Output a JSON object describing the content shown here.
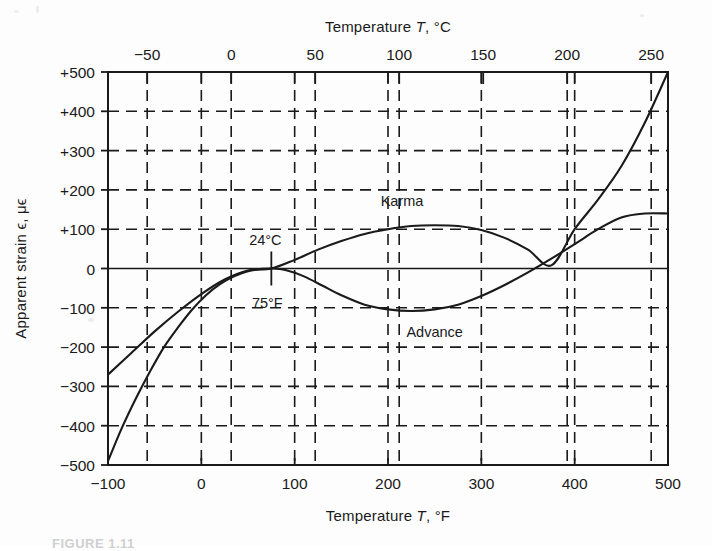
{
  "figure": {
    "caption": "FIGURE 1.11",
    "background_color": "#fdfdfd",
    "ink_color": "#1a1a1a"
  },
  "chart_data": {
    "type": "line",
    "title": "",
    "subtitle": "",
    "xlabel": "Temperature T, °F",
    "xlabel_top": "Temperature T, °C",
    "ylabel": "Apparent strain ϵ, μϵ",
    "xlim": [
      -100,
      500
    ],
    "ylim": [
      -500,
      500
    ],
    "xlim_celsius": [
      -73.3,
      260
    ],
    "grid": true,
    "grid_style": "dashed",
    "legend_position": "inline-annotation",
    "x_ticks_bottom": [
      "-100",
      "0",
      "100",
      "200",
      "300",
      "400",
      "500"
    ],
    "x_tick_values_bottom": [
      -100,
      0,
      100,
      200,
      300,
      400,
      500
    ],
    "x_ticks_top": [
      "-50",
      "0",
      "50",
      "100",
      "150",
      "200",
      "250"
    ],
    "x_tick_values_top": [
      -50,
      0,
      50,
      100,
      150,
      200,
      250
    ],
    "y_ticks": [
      "+500",
      "+400",
      "+300",
      "+200",
      "+100",
      "0",
      "-100",
      "-200",
      "-300",
      "-400",
      "-500"
    ],
    "y_tick_values": [
      500,
      400,
      300,
      200,
      100,
      0,
      -100,
      -200,
      -300,
      -400,
      -500
    ],
    "annotations": [
      {
        "name": "reference-temp-celsius",
        "text": "24°C",
        "x": 75,
        "y": 0
      },
      {
        "name": "reference-temp-fahrenheit",
        "text": "75°F",
        "x": 75,
        "y": 0
      }
    ],
    "series": [
      {
        "name": "Karma",
        "label": "Karma",
        "color": "#1a1a1a",
        "points": [
          [
            -100,
            -270
          ],
          [
            -75,
            -215
          ],
          [
            -50,
            -160
          ],
          [
            -25,
            -110
          ],
          [
            0,
            -65
          ],
          [
            25,
            -28
          ],
          [
            50,
            -5
          ],
          [
            75,
            0
          ],
          [
            100,
            22
          ],
          [
            125,
            48
          ],
          [
            150,
            70
          ],
          [
            175,
            88
          ],
          [
            200,
            100
          ],
          [
            225,
            108
          ],
          [
            250,
            110
          ],
          [
            275,
            108
          ],
          [
            300,
            98
          ],
          [
            325,
            78
          ],
          [
            350,
            48
          ],
          [
            375,
            8
          ],
          [
            400,
            100
          ],
          [
            425,
            175
          ],
          [
            450,
            260
          ],
          [
            475,
            370
          ],
          [
            500,
            500
          ]
        ]
      },
      {
        "name": "Advance",
        "label": "Advance",
        "color": "#1a1a1a",
        "points": [
          [
            -100,
            -490
          ],
          [
            -85,
            -405
          ],
          [
            -70,
            -330
          ],
          [
            -55,
            -262
          ],
          [
            -40,
            -200
          ],
          [
            -25,
            -150
          ],
          [
            -10,
            -105
          ],
          [
            5,
            -68
          ],
          [
            20,
            -40
          ],
          [
            35,
            -20
          ],
          [
            50,
            -7
          ],
          [
            65,
            -1
          ],
          [
            75,
            0
          ],
          [
            90,
            -4
          ],
          [
            110,
            -20
          ],
          [
            130,
            -44
          ],
          [
            150,
            -68
          ],
          [
            175,
            -92
          ],
          [
            200,
            -104
          ],
          [
            225,
            -108
          ],
          [
            250,
            -104
          ],
          [
            275,
            -92
          ],
          [
            300,
            -70
          ],
          [
            325,
            -42
          ],
          [
            350,
            -10
          ],
          [
            375,
            25
          ],
          [
            400,
            62
          ],
          [
            425,
            100
          ],
          [
            450,
            130
          ],
          [
            475,
            140
          ],
          [
            500,
            140
          ]
        ]
      }
    ]
  },
  "axes": {
    "top_title": "Temperature T, °C",
    "bottom_title": "Temperature T, °F",
    "left_title": "Apparent strain ϵ, μϵ"
  }
}
